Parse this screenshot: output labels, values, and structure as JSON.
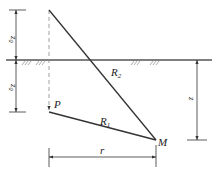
{
  "diagram": {
    "labels": {
      "P": "P",
      "M": "M",
      "R1": "R",
      "R1_sub": "1",
      "R2": "R",
      "R2_sub": "2",
      "r": "r",
      "z": "z",
      "z0_top": "z",
      "z0_top_sub": "0",
      "z0_bottom": "z",
      "z0_bottom_sub": "0"
    },
    "colors": {
      "line": "#333333",
      "dashed": "#888888",
      "ground": "#555555"
    }
  }
}
